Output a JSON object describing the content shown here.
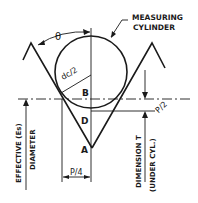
{
  "diagram": {
    "labels": {
      "measuring_cylinder_line1": "MEASURING",
      "measuring_cylinder_line2": "CYLINDER",
      "theta": "θ",
      "radius": "dc/2",
      "point_b": "B",
      "point_d": "D",
      "point_a": "A",
      "half_pitch": "P/2",
      "quarter_pitch": "P/4",
      "effective_diameter_line1": "EFFECTIVE (Es)",
      "effective_diameter_line2": "DIAMETER",
      "dimension_t_line1": "DIMENSION T",
      "dimension_t_line2": "(UNDER CYL.)"
    },
    "colors": {
      "ink": "#1a1a1a",
      "background": "#ffffff"
    }
  }
}
